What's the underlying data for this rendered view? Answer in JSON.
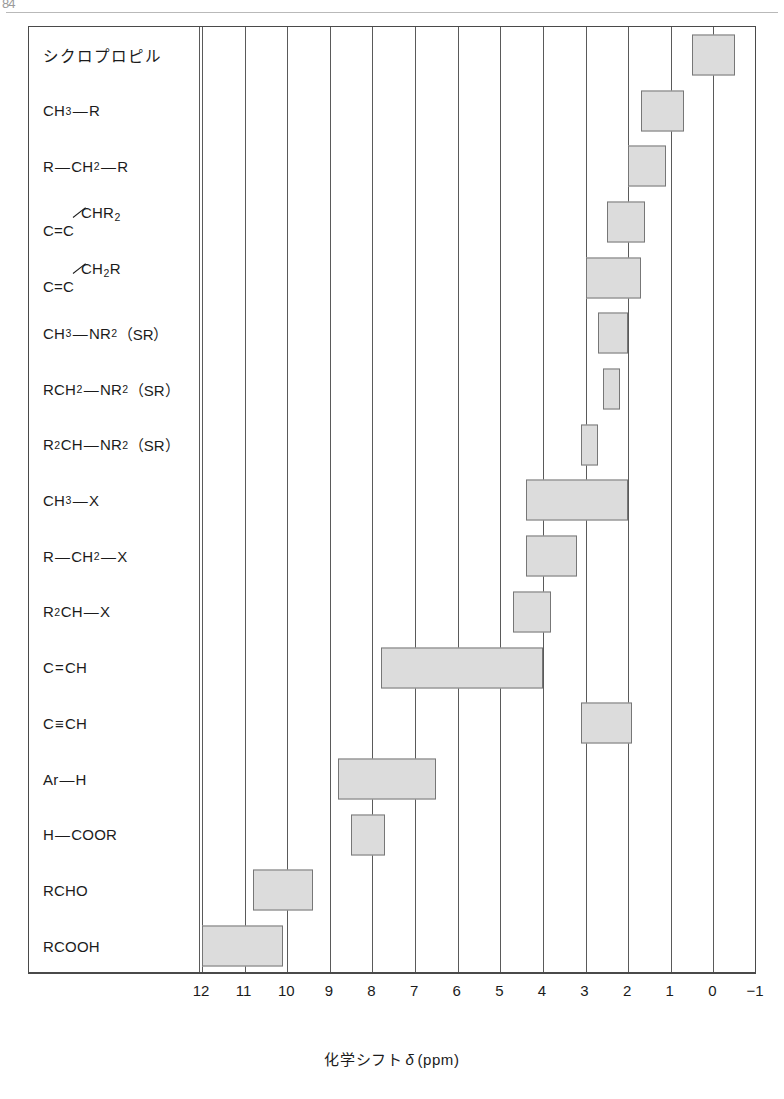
{
  "figure": {
    "axis_caption_pre": "化学シフト",
    "axis_caption_delta": "δ",
    "axis_caption_unit": "(ppm)",
    "scan_mark": "84"
  },
  "chart_data": {
    "type": "bar",
    "orientation": "horizontal-ranges",
    "title": "",
    "xlabel": "化学シフト δ (ppm)",
    "ylabel": "",
    "xlim": [
      12,
      -1
    ],
    "x_reversed": true,
    "grid": true,
    "legend": "none",
    "tick_labels": [
      "12",
      "11",
      "10",
      "9",
      "8",
      "7",
      "6",
      "5",
      "4",
      "3",
      "2",
      "1",
      "0",
      "-1"
    ],
    "tick_values": [
      12,
      11,
      10,
      9,
      8,
      7,
      6,
      5,
      4,
      3,
      2,
      1,
      0,
      -1
    ],
    "categories": [
      "シクロプロピル",
      "CH3-R",
      "R-CH2-R",
      "C=C-CHR2",
      "C=C-CH2R",
      "CH3-NR2 (SR)",
      "RCH2-NR2 (SR)",
      "R2CH-NR2 (SR)",
      "CH3-X",
      "R-CH2-X",
      "R2CH-X",
      "C=CH",
      "C≡CH",
      "Ar-H",
      "H-COOR",
      "RCHO",
      "RCOOH"
    ],
    "ranges": [
      [
        0.5,
        -0.5
      ],
      [
        1.7,
        0.7
      ],
      [
        2.0,
        1.1
      ],
      [
        2.5,
        1.6
      ],
      [
        3.0,
        1.7
      ],
      [
        2.7,
        2.0
      ],
      [
        2.6,
        2.2
      ],
      [
        3.1,
        2.7
      ],
      [
        4.4,
        2.0
      ],
      [
        4.4,
        3.2
      ],
      [
        4.7,
        3.8
      ],
      [
        7.8,
        4.0
      ],
      [
        3.1,
        1.9
      ],
      [
        8.8,
        6.5
      ],
      [
        8.5,
        7.7
      ],
      [
        10.8,
        9.4
      ],
      [
        12.0,
        10.1
      ]
    ],
    "rows": [
      {
        "id": "cyclopropyl",
        "label_kind": "jp",
        "label": "シクロプロピル",
        "from": 0.5,
        "to": -0.5
      },
      {
        "id": "ch3-r",
        "label_kind": "formula",
        "label": "CH3-R",
        "parts": [
          {
            "t": "CH"
          },
          {
            "t": "3",
            "sub": true
          },
          {
            "t": "—",
            "bond": true
          },
          {
            "t": "R"
          }
        ],
        "from": 1.7,
        "to": 0.7
      },
      {
        "id": "r-ch2-r",
        "label_kind": "formula",
        "label": "R-CH2-R",
        "parts": [
          {
            "t": "R"
          },
          {
            "t": "—",
            "bond": true
          },
          {
            "t": "CH"
          },
          {
            "t": "2",
            "sub": true
          },
          {
            "t": "—",
            "bond": true
          },
          {
            "t": "R"
          }
        ],
        "from": 2.0,
        "to": 1.1
      },
      {
        "id": "vinyl-chr2",
        "label_kind": "slant",
        "label": "C=C-CHR2",
        "base": "C=C",
        "branch_parts": [
          {
            "t": "CHR"
          },
          {
            "t": "2",
            "sub": true
          }
        ],
        "from": 2.5,
        "to": 1.6
      },
      {
        "id": "vinyl-ch2r",
        "label_kind": "slant",
        "label": "C=C-CH2R",
        "base": "C=C",
        "branch_parts": [
          {
            "t": "CH"
          },
          {
            "t": "2",
            "sub": true
          },
          {
            "t": "R"
          }
        ],
        "from": 3.0,
        "to": 1.7
      },
      {
        "id": "ch3-nr2",
        "label_kind": "formula",
        "label": "CH3-NR2 (SR)",
        "parts": [
          {
            "t": "CH"
          },
          {
            "t": "3",
            "sub": true
          },
          {
            "t": "—",
            "bond": true
          },
          {
            "t": "NR"
          },
          {
            "t": "2",
            "sub": true
          },
          {
            "t": "（SR）",
            "paren": true
          }
        ],
        "from": 2.7,
        "to": 2.0
      },
      {
        "id": "rch2-nr2",
        "label_kind": "formula",
        "label": "RCH2-NR2 (SR)",
        "parts": [
          {
            "t": "RCH"
          },
          {
            "t": "2",
            "sub": true
          },
          {
            "t": "—",
            "bond": true
          },
          {
            "t": "NR"
          },
          {
            "t": "2",
            "sub": true
          },
          {
            "t": "（SR）",
            "paren": true
          }
        ],
        "from": 2.6,
        "to": 2.2
      },
      {
        "id": "r2ch-nr2",
        "label_kind": "formula",
        "label": "R2CH-NR2 (SR)",
        "parts": [
          {
            "t": "R"
          },
          {
            "t": "2",
            "sub": true
          },
          {
            "t": "CH"
          },
          {
            "t": "—",
            "bond": true
          },
          {
            "t": "NR"
          },
          {
            "t": "2",
            "sub": true
          },
          {
            "t": "（SR）",
            "paren": true
          }
        ],
        "from": 3.1,
        "to": 2.7
      },
      {
        "id": "ch3-x",
        "label_kind": "formula",
        "label": "CH3-X",
        "parts": [
          {
            "t": "CH"
          },
          {
            "t": "3",
            "sub": true
          },
          {
            "t": "—",
            "bond": true
          },
          {
            "t": "X"
          }
        ],
        "from": 4.4,
        "to": 2.0
      },
      {
        "id": "r-ch2-x",
        "label_kind": "formula",
        "label": "R-CH2-X",
        "parts": [
          {
            "t": "R"
          },
          {
            "t": "—",
            "bond": true
          },
          {
            "t": "CH"
          },
          {
            "t": "2",
            "sub": true
          },
          {
            "t": "—",
            "bond": true
          },
          {
            "t": "X"
          }
        ],
        "from": 4.4,
        "to": 3.2
      },
      {
        "id": "r2ch-x",
        "label_kind": "formula",
        "label": "R2CH-X",
        "parts": [
          {
            "t": "R"
          },
          {
            "t": "2",
            "sub": true
          },
          {
            "t": "CH"
          },
          {
            "t": "—",
            "bond": true
          },
          {
            "t": "X"
          }
        ],
        "from": 4.7,
        "to": 3.8
      },
      {
        "id": "alkene-ch",
        "label_kind": "formula",
        "label": "C=CH",
        "parts": [
          {
            "t": "C"
          },
          {
            "t": "=",
            "bond": true
          },
          {
            "t": "CH"
          }
        ],
        "from": 7.8,
        "to": 4.0
      },
      {
        "id": "alkyne-ch",
        "label_kind": "formula",
        "label": "C≡CH",
        "parts": [
          {
            "t": "C"
          },
          {
            "t": "≡",
            "bond": true
          },
          {
            "t": "CH"
          }
        ],
        "from": 3.1,
        "to": 1.9
      },
      {
        "id": "ar-h",
        "label_kind": "formula",
        "label": "Ar-H",
        "parts": [
          {
            "t": "Ar"
          },
          {
            "t": "—",
            "bond": true
          },
          {
            "t": "H"
          }
        ],
        "from": 8.8,
        "to": 6.5
      },
      {
        "id": "h-coor",
        "label_kind": "formula",
        "label": "H-COOR",
        "parts": [
          {
            "t": "H"
          },
          {
            "t": "—",
            "bond": true
          },
          {
            "t": "COOR"
          }
        ],
        "from": 8.5,
        "to": 7.7
      },
      {
        "id": "rcho",
        "label_kind": "formula",
        "label": "RCHO",
        "parts": [
          {
            "t": "RCHO"
          }
        ],
        "from": 10.8,
        "to": 9.4
      },
      {
        "id": "rcooh",
        "label_kind": "formula",
        "label": "RCOOH",
        "parts": [
          {
            "t": "RCOOH"
          }
        ],
        "from": 12.0,
        "to": 10.1
      }
    ]
  },
  "colors": {
    "bar_fill": "#dcdcdc",
    "bar_stroke": "#777777",
    "frame": "#4a4a4a",
    "grid": "#5a5a5a",
    "text": "#1b1b1b"
  }
}
